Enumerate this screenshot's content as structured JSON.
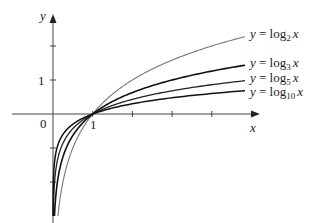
{
  "chart_data": {
    "type": "line",
    "title": "",
    "xlabel": "x",
    "ylabel": "y",
    "origin_label": "0",
    "x_ticks": [
      1,
      2,
      3,
      4
    ],
    "x_tick_labels": [
      "1"
    ],
    "y_ticks": [
      -2,
      -1,
      1,
      2
    ],
    "y_tick_labels": [
      "1"
    ],
    "xlim": [
      0,
      5.2
    ],
    "ylim": [
      -3,
      2.9
    ],
    "grid": false,
    "legend_position": "inline-right",
    "series": [
      {
        "name": "y = log2 x",
        "base": 2,
        "label_main": "y = log",
        "label_sub": "2",
        "label_var": "x",
        "stroke": "#777777",
        "width": 1.1
      },
      {
        "name": "y = log3 x",
        "base": 3,
        "label_main": "y = log",
        "label_sub": "3",
        "label_var": "x",
        "stroke": "#111111",
        "width": 1.6
      },
      {
        "name": "y = log5 x",
        "base": 5,
        "label_main": "y = log",
        "label_sub": "5",
        "label_var": "x",
        "stroke": "#222222",
        "width": 1.3
      },
      {
        "name": "y = log10 x",
        "base": 10,
        "label_main": "y = log",
        "label_sub": "10",
        "label_var": "x",
        "stroke": "#111111",
        "width": 1.5
      }
    ]
  }
}
